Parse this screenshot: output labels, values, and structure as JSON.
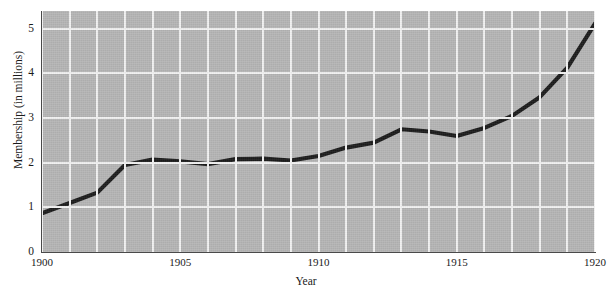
{
  "chart_data": {
    "type": "line",
    "title": "",
    "xlabel": "Year",
    "ylabel": "Membership (in millions)",
    "xlim": [
      1900,
      1920
    ],
    "ylim": [
      0,
      5.4
    ],
    "xticks": [
      "1900",
      "1905",
      "1910",
      "1915",
      "1920"
    ],
    "xtick_values": [
      1900,
      1905,
      1910,
      1915,
      1920
    ],
    "yticks": [
      "0",
      "1",
      "2",
      "3",
      "4",
      "5"
    ],
    "ytick_values": [
      0,
      1,
      2,
      3,
      4,
      5
    ],
    "grid": "both-axes-white-gridlines-every-year-and-every-unit",
    "legend": "none",
    "x": [
      1900,
      1901,
      1902,
      1903,
      1904,
      1905,
      1906,
      1907,
      1908,
      1909,
      1910,
      1911,
      1912,
      1913,
      1914,
      1915,
      1916,
      1917,
      1918,
      1919,
      1920
    ],
    "values": [
      0.87,
      1.1,
      1.33,
      1.95,
      2.07,
      2.03,
      1.97,
      2.08,
      2.09,
      2.05,
      2.15,
      2.34,
      2.45,
      2.75,
      2.7,
      2.6,
      2.78,
      3.05,
      3.47,
      4.13,
      5.12
    ],
    "series": [
      {
        "name": "Membership",
        "color": "#1c1c1c",
        "values": [
          0.87,
          1.1,
          1.33,
          1.95,
          2.07,
          2.03,
          1.97,
          2.08,
          2.09,
          2.05,
          2.15,
          2.34,
          2.45,
          2.75,
          2.7,
          2.6,
          2.78,
          3.05,
          3.47,
          4.13,
          5.12
        ]
      }
    ],
    "plot_background_color": "#b6b6b6",
    "gridline_color": "#f2f2f2",
    "axis_color": "#4a4a4a"
  }
}
